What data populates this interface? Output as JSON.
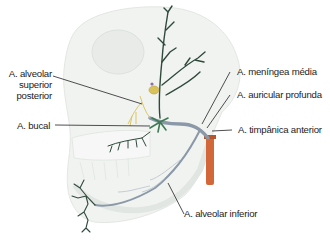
{
  "figure": {
    "colors": {
      "artery_main": "#8a98a8",
      "artery_branches": "#2f4a3c",
      "artery_green_accent": "#3d7a55",
      "external_carotid": "#d2683a",
      "nerve_yellow": "#d9c25a",
      "bone_outline": "#e9ece8",
      "leader_line": "#222222"
    }
  },
  "labels": {
    "alveolar_superior_posterior": {
      "line1": "A. alveolar",
      "line2": "superior",
      "line3": "posterior"
    },
    "bucal": "A. bucal",
    "meningea_media": "A. meníngea média",
    "auricular_profunda": "A. auricular profunda",
    "timpanica_anterior": "A. timpânica anterior",
    "alveolar_inferior": "A. alveolar inferior"
  }
}
